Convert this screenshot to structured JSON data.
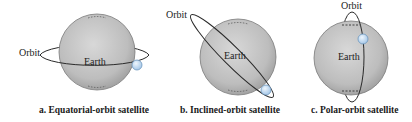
{
  "panels": [
    {
      "id": "a",
      "caption": "a. Equatorial-orbit satellite",
      "orbit_label": "Orbit",
      "earth_label": "Earth",
      "orbit_type": "equatorial"
    },
    {
      "id": "b",
      "caption": "b. Inclined-orbit satellite",
      "orbit_label": "Orbit",
      "earth_label": "Earth",
      "orbit_type": "inclined"
    },
    {
      "id": "c",
      "caption": "c. Polar-orbit satellite",
      "orbit_label": "Orbit",
      "earth_label": "Earth",
      "orbit_type": "polar"
    }
  ],
  "colors": {
    "earth_fill": "#bdbdbd",
    "earth_stroke": "#6f6f6f",
    "orbit_stroke": "#2a2a2a",
    "satellite_fill": "#bcd8f2",
    "satellite_stroke": "#5f8fb8"
  }
}
